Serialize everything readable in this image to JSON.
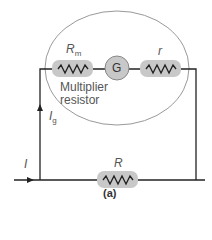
{
  "diagram": {
    "caption": "(a)",
    "labels": {
      "multiplier_resistor_symbol": "R",
      "multiplier_resistor_sub": "m",
      "galvanometer": "G",
      "internal_resistance": "r",
      "multiplier_text_line1": "Multiplier",
      "multiplier_text_line2": "resistor",
      "galvanometer_current": "I",
      "galvanometer_current_sub": "g",
      "total_current": "I",
      "shunt_resistor": "R"
    },
    "colors": {
      "wire": "#222222",
      "resistor_bg": "#c8c8c8",
      "ellipse": "#999999",
      "galvanometer_bg": "#c8c8c8",
      "text": "#555555"
    }
  }
}
